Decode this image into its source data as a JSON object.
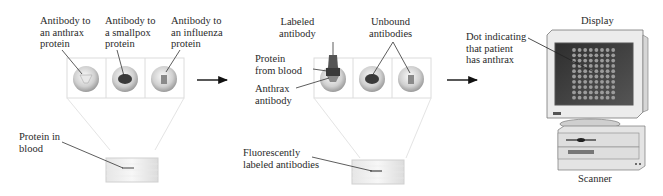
{
  "panel1": {
    "labels": {
      "anthrax": [
        "Antibody to",
        "an anthrax",
        "protein"
      ],
      "smallpox": [
        "Antibody to",
        "a smallpox",
        "protein"
      ],
      "influenza": [
        "Antibody to",
        "an influenza",
        "protein"
      ],
      "protein_in_blood": [
        "Protein in",
        "blood"
      ]
    }
  },
  "panel2": {
    "labels": {
      "labeled_antibody": [
        "Labeled",
        "antibody"
      ],
      "unbound_antibodies": [
        "Unbound",
        "antibodies"
      ],
      "protein_from_blood": [
        "Protein",
        "from blood"
      ],
      "anthrax_antibody": [
        "Anthrax",
        "antibody"
      ],
      "fluorescent": [
        "Fluorescently",
        "labeled antibodies"
      ]
    }
  },
  "panel3": {
    "labels": {
      "display": "Display",
      "dot": [
        "Dot indicating",
        "that patient",
        "has anthrax"
      ],
      "scanner": "Scanner"
    },
    "dot_grid": {
      "columns": 8,
      "rows": 10
    }
  },
  "colors": {
    "line": "#333333",
    "well_light": "#f2f2f2",
    "well_dark": "#9a9a9a",
    "blob": "#3a3a3a",
    "label_tag": "#555555",
    "screen": "#3b3b3b",
    "dot": "#9c9c9c",
    "case": "#e4e4e4"
  }
}
